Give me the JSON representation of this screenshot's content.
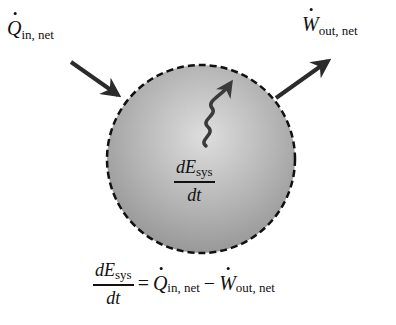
{
  "diagram": {
    "system": {
      "shape": "circle",
      "boundary": "dashed",
      "fill_gradient": [
        "#d9d9d9",
        "#9a9a9a"
      ],
      "inner_label": {
        "numerator": "dE",
        "numerator_sub": "sys",
        "denominator": "dt"
      },
      "inner_icon": "wavy-arrow-icon"
    },
    "heat_input": {
      "symbol": "Q",
      "has_dot": true,
      "subscript": "in, net",
      "arrow_direction": "into system"
    },
    "work_output": {
      "symbol": "W",
      "has_dot": true,
      "subscript": "out, net",
      "arrow_direction": "out of system"
    },
    "equation": {
      "lhs_numerator": "dE",
      "lhs_numerator_sub": "sys",
      "lhs_denominator": "dt",
      "equals": "=",
      "term1_symbol": "Q",
      "term1_sub": "in, net",
      "operator": "−",
      "term2_symbol": "W",
      "term2_sub": "out, net"
    },
    "colors": {
      "arrow": "#2b2b2b",
      "boundary": "#111111",
      "text": "#111111"
    }
  }
}
